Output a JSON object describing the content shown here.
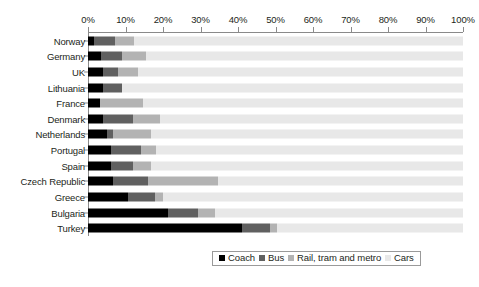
{
  "chart_data": {
    "type": "bar",
    "orientation": "horizontal",
    "stacked": true,
    "stack_mode": "percent",
    "title": "",
    "xlabel": "",
    "ylabel": "",
    "xlim": [
      0,
      100
    ],
    "grid": false,
    "legend_position": "bottom",
    "axis_tick_labels": [
      "0%",
      "10%",
      "20%",
      "30%",
      "40%",
      "50%",
      "60%",
      "70%",
      "80%",
      "90%",
      "100%"
    ],
    "axis_tick_values": [
      0,
      10,
      20,
      30,
      40,
      50,
      60,
      70,
      80,
      90,
      100
    ],
    "categories": [
      "Norway",
      "Germany",
      "UK",
      "Lithuania",
      "France",
      "Denmark",
      "Netherlands",
      "Portugal",
      "Spain",
      "Czech Republic",
      "Greece",
      "Bulgaria",
      "Turkey"
    ],
    "series": [
      {
        "name": "Coach",
        "color": "#000000",
        "values": [
          1.5,
          3.5,
          4.0,
          4.0,
          3.2,
          4.0,
          5.0,
          6.0,
          6.0,
          6.7,
          10.7,
          21.3,
          41.1
        ]
      },
      {
        "name": "Bus",
        "color": "#606060",
        "values": [
          5.6,
          5.6,
          4.0,
          5.1,
          0.0,
          8.0,
          1.6,
          8.0,
          5.9,
          9.3,
          7.2,
          8.0,
          7.5
        ]
      },
      {
        "name": "Rail, tram and metro",
        "color": "#b3b3b3",
        "values": [
          5.1,
          6.4,
          5.3,
          0.0,
          11.5,
          7.2,
          10.1,
          4.0,
          4.8,
          18.7,
          2.1,
          4.5,
          1.9
        ]
      },
      {
        "name": "Cars",
        "color": "#e8e8e8",
        "values": [
          87.8,
          84.5,
          86.7,
          90.9,
          85.3,
          80.8,
          83.3,
          82.0,
          83.3,
          65.3,
          80.0,
          66.2,
          49.5
        ]
      }
    ]
  },
  "legend": {
    "items": [
      {
        "label": "Coach",
        "color": "#000000"
      },
      {
        "label": "Bus",
        "color": "#606060"
      },
      {
        "label": "Rail, tram and metro",
        "color": "#b3b3b3"
      },
      {
        "label": "Cars",
        "color": "#e8e8e8"
      }
    ]
  },
  "caption": ""
}
